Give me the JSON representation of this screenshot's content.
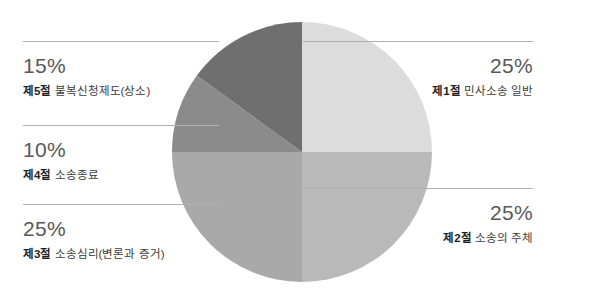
{
  "chart_data": {
    "type": "pie",
    "title": "",
    "subtitle": "",
    "xlabel": "",
    "ylabel": "",
    "legend_position": "outside-left-right",
    "grid": false,
    "total": 100,
    "unit": "%",
    "categories": [
      "제1절 민사소송 일반",
      "제2절 소송의 주체",
      "제3절 소송심리(변론과 증거)",
      "제4절 소송종료",
      "제5절 불복신청제도(상소)"
    ],
    "values": [
      25,
      25,
      25,
      10,
      15
    ],
    "slices": [
      {
        "id": "slice-1",
        "section": "제1절",
        "name": "민사소송 일반",
        "full_label": "제1절 민사소송 일반",
        "value": 25,
        "percent_label": "25%",
        "color": "#dcdcdc",
        "start_angle": 0,
        "end_angle": 90,
        "side": "right"
      },
      {
        "id": "slice-2",
        "section": "제2절",
        "name": "소송의 주체",
        "full_label": "제2절 소송의 주체",
        "value": 25,
        "percent_label": "25%",
        "color": "#b9b9b9",
        "start_angle": 90,
        "end_angle": 180,
        "side": "right"
      },
      {
        "id": "slice-3",
        "section": "제3절",
        "name": "소송심리(변론과 증거)",
        "full_label": "제3절 소송심리(변론과 증거)",
        "value": 25,
        "percent_label": "25%",
        "color": "#a9a9a9",
        "start_angle": 180,
        "end_angle": 270,
        "side": "left"
      },
      {
        "id": "slice-4",
        "section": "제4절",
        "name": "소송종료",
        "full_label": "제4절 소송종료",
        "value": 10,
        "percent_label": "10%",
        "color": "#8b8b8b",
        "start_angle": 270,
        "end_angle": 306,
        "side": "left"
      },
      {
        "id": "slice-5",
        "section": "제5절",
        "name": "불복신청제도(상소)",
        "full_label": "제5절 불복신청제도(상소)",
        "value": 15,
        "percent_label": "15%",
        "color": "#6f6f6f",
        "start_angle": 306,
        "end_angle": 360,
        "side": "left"
      }
    ],
    "geometry": {
      "center_x": 130,
      "center_y": 130,
      "radius": 130
    },
    "colors": {
      "background": "#ffffff",
      "divider": "#b0b0b0",
      "percent_text": "#58585a",
      "caption_text": "#3c3c3c",
      "section_text": "#1f1f1f"
    }
  }
}
